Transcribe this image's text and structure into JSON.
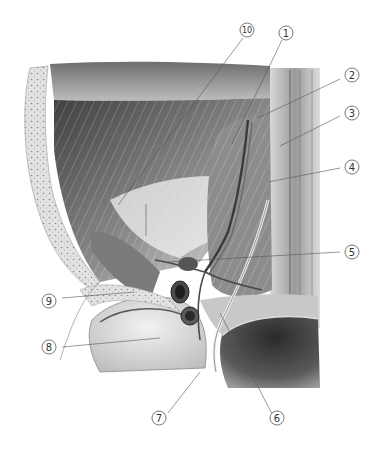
{
  "figure": {
    "style": "grayscale pencil drawing",
    "colors": {
      "background": "#ffffff",
      "ink_dark": "#2a2a2a",
      "muscle_mid": "#8a8a8a",
      "muscle_light": "#cfcfcf",
      "bone": "#e6e6e6",
      "leader_line": "#555555"
    }
  },
  "labels": [
    {
      "id": "label-1",
      "text": "1"
    },
    {
      "id": "label-2",
      "text": "2"
    },
    {
      "id": "label-3",
      "text": "3"
    },
    {
      "id": "label-4",
      "text": "4"
    },
    {
      "id": "label-5",
      "text": "5"
    },
    {
      "id": "label-6",
      "text": "6"
    },
    {
      "id": "label-7",
      "text": "7"
    },
    {
      "id": "label-8",
      "text": "8"
    },
    {
      "id": "label-9",
      "text": "9"
    },
    {
      "id": "label-10",
      "text": "10"
    }
  ]
}
